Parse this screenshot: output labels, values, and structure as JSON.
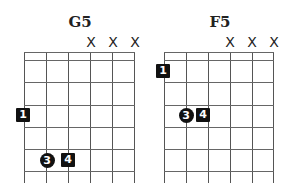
{
  "chords": [
    {
      "name": "G5",
      "strings": 6,
      "muted_strings": [
        4,
        5,
        6
      ],
      "mute_symbol": "X",
      "fingers": [
        {
          "label": "1",
          "string": 1,
          "fret": 3,
          "shape": "square"
        },
        {
          "label": "3",
          "string": 2,
          "fret": 5,
          "shape": "circle"
        },
        {
          "label": "4",
          "string": 3,
          "fret": 5,
          "shape": "square"
        }
      ]
    },
    {
      "name": "F5",
      "strings": 6,
      "muted_strings": [
        4,
        5,
        6
      ],
      "mute_symbol": "X",
      "fingers": [
        {
          "label": "1",
          "string": 1,
          "fret": 1,
          "shape": "square"
        },
        {
          "label": "3",
          "string": 2,
          "fret": 3,
          "shape": "circle"
        },
        {
          "label": "4",
          "string": 3,
          "fret": 3,
          "shape": "square"
        }
      ]
    }
  ]
}
